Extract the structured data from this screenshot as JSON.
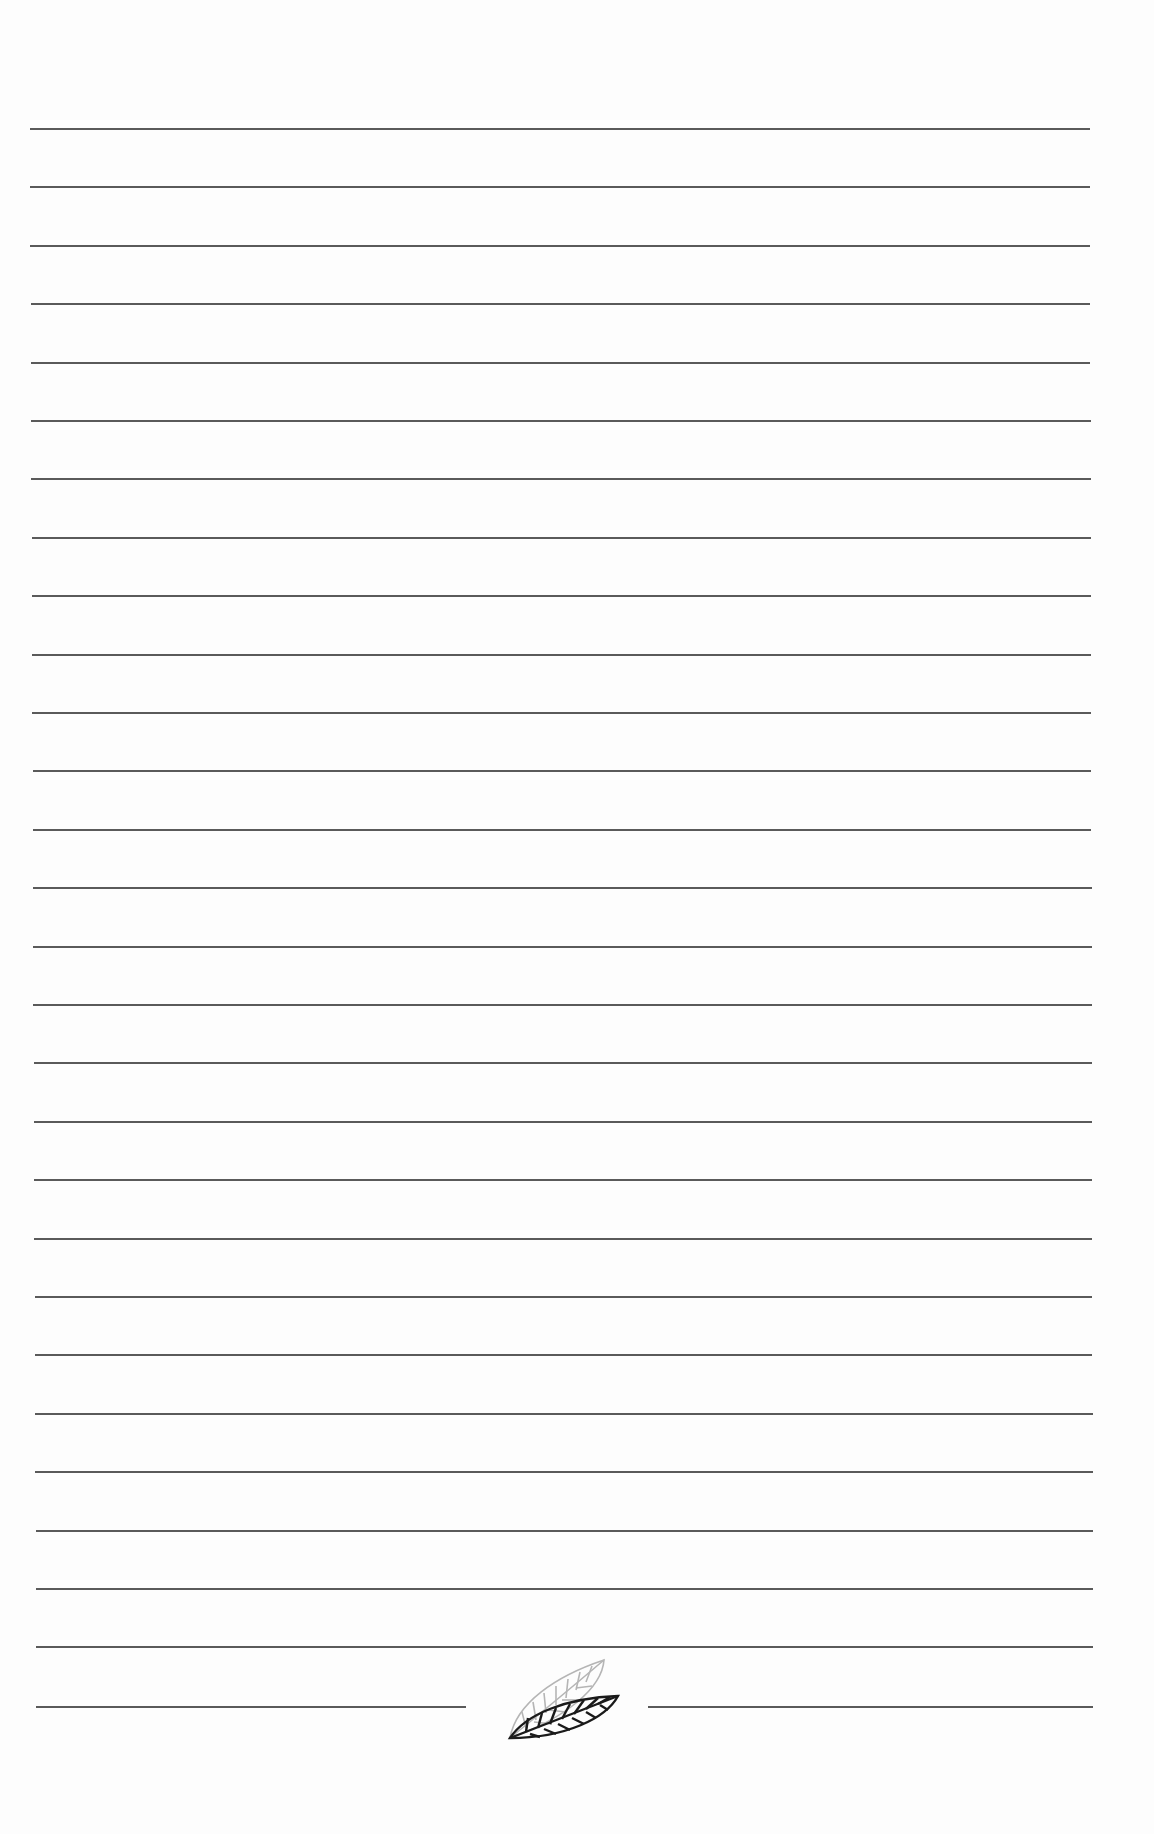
{
  "page": {
    "type": "ruled-notebook-page",
    "background_color": "#fdfdfd",
    "line_color": "#5a5a5a",
    "line_count": 27,
    "first_line_y": 128,
    "line_spacing": 58.4,
    "line_left_start": 30,
    "line_left_end": 36,
    "line_right_start": 1090,
    "line_right_end": 1093
  },
  "footer_line": {
    "y": 1706,
    "left_segment": [
      36,
      466
    ],
    "right_segment": [
      648,
      1093
    ]
  },
  "ornament": {
    "icon": "leaf-pair-icon",
    "front_leaf_color": "#1a1a1a",
    "back_leaf_color": "#b0b0b0"
  }
}
